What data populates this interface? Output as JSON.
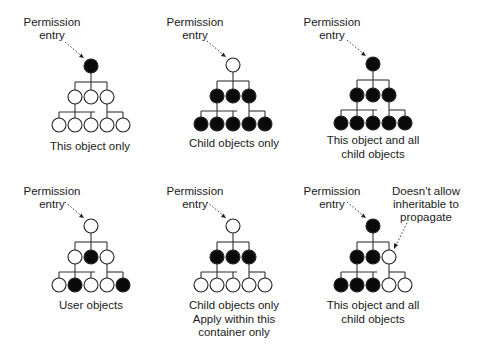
{
  "diagram": {
    "colors": {
      "filled": "#0a0a0a",
      "empty": "#ffffff",
      "line": "#333333",
      "text": "#1a1a1a"
    },
    "legend_note": "Filled circle = permission applies; empty circle = not applied",
    "panels": [
      {
        "id": "this-object-only",
        "pointer_label": [
          "Permission",
          "entry"
        ],
        "caption": [
          "This object only"
        ],
        "root": "filled",
        "middle": [
          "empty",
          "empty",
          "empty"
        ],
        "bottom": [
          "empty",
          "empty",
          "empty",
          "empty",
          "empty"
        ]
      },
      {
        "id": "child-objects-only",
        "pointer_label": [
          "Permission",
          "entry"
        ],
        "caption": [
          "Child objects only"
        ],
        "root": "empty",
        "middle": [
          "filled",
          "filled",
          "filled"
        ],
        "bottom": [
          "filled",
          "filled",
          "filled",
          "filled",
          "filled"
        ]
      },
      {
        "id": "this-object-and-all-child-objects",
        "pointer_label": [
          "Permission",
          "entry"
        ],
        "caption": [
          "This object and all",
          "child objects"
        ],
        "root": "filled",
        "middle": [
          "filled",
          "filled",
          "filled"
        ],
        "bottom": [
          "filled",
          "filled",
          "filled",
          "filled",
          "filled"
        ]
      },
      {
        "id": "user-objects",
        "pointer_label": [
          "Permission",
          "entry"
        ],
        "caption": [
          "User objects"
        ],
        "root": "empty",
        "middle": [
          "empty",
          "filled",
          "empty"
        ],
        "bottom": [
          "empty",
          "filled",
          "empty",
          "empty",
          "filled"
        ]
      },
      {
        "id": "child-objects-only-apply-within-container",
        "pointer_label": [
          "Permission",
          "entry"
        ],
        "caption": [
          "Child objects only",
          "Apply within this",
          "container only"
        ],
        "root": "empty",
        "middle": [
          "filled",
          "filled",
          "filled"
        ],
        "bottom": [
          "empty",
          "empty",
          "empty",
          "empty",
          "empty"
        ]
      },
      {
        "id": "blocked-inheritance",
        "pointer_label": [
          "Permission",
          "entry"
        ],
        "caption": [
          "This object and all",
          "child objects"
        ],
        "annotation": [
          "Doesn't allow",
          "inheritable to",
          "propagate"
        ],
        "root": "filled",
        "middle": [
          "filled",
          "filled",
          "empty"
        ],
        "bottom": [
          "filled",
          "filled",
          "filled",
          "empty",
          "empty"
        ]
      }
    ]
  }
}
